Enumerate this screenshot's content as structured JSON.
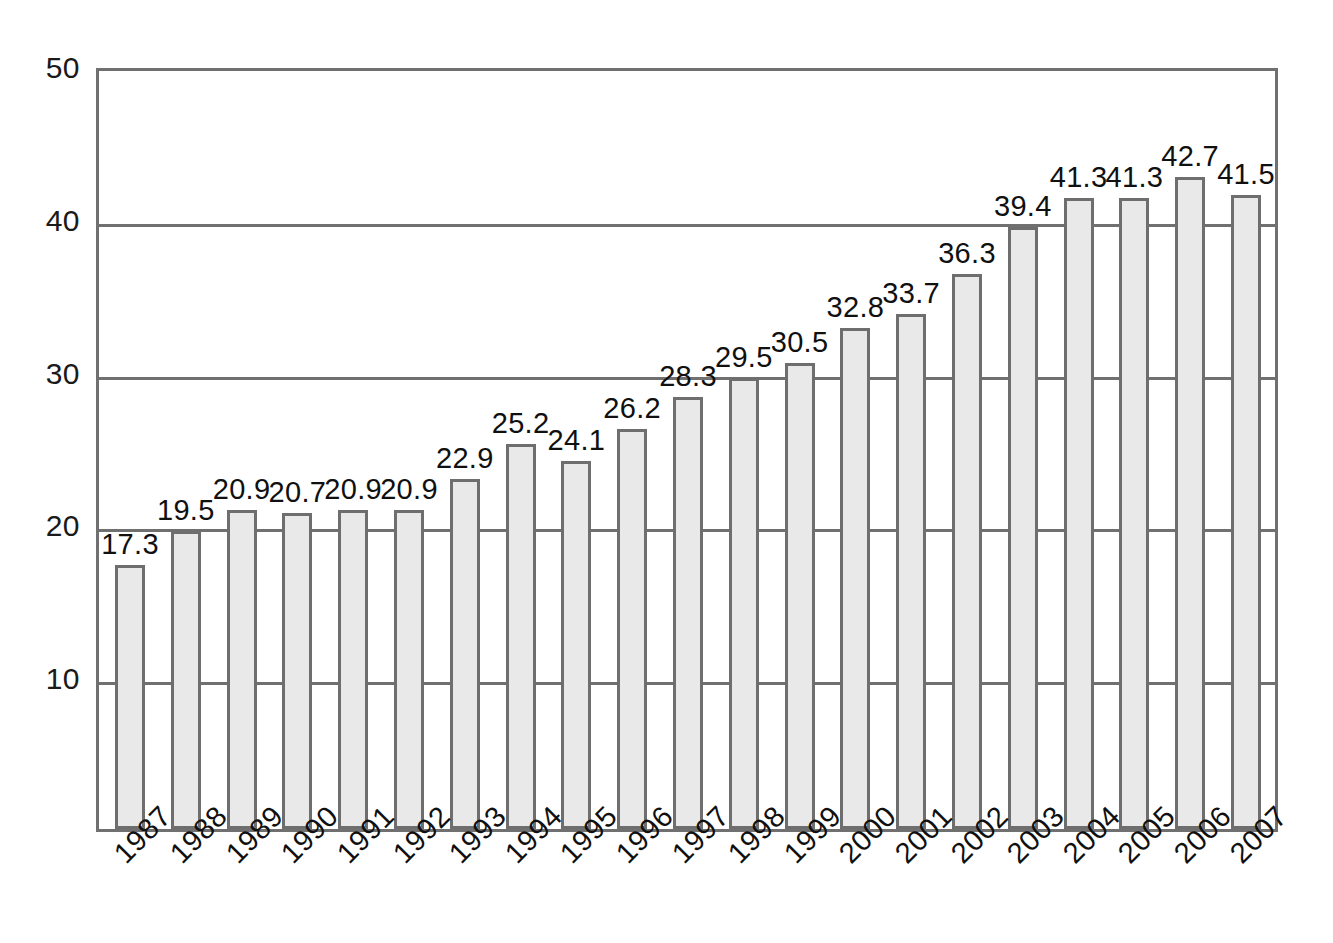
{
  "chart_data": {
    "type": "bar",
    "title": "",
    "subtitle": "",
    "xlabel": "",
    "ylabel": "",
    "ylim": [
      0,
      50
    ],
    "yticks": [
      10,
      20,
      30,
      40,
      50
    ],
    "grid": true,
    "legend": null,
    "categories": [
      "1987",
      "1988",
      "1989",
      "1990",
      "1991",
      "1992",
      "1993",
      "1994",
      "1995",
      "1996",
      "1997",
      "1998",
      "1999",
      "2000",
      "2001",
      "2002",
      "2003",
      "2004",
      "2005",
      "2006",
      "2007"
    ],
    "values": [
      17.3,
      19.5,
      20.9,
      20.7,
      20.9,
      20.9,
      22.9,
      25.2,
      24.1,
      26.2,
      28.3,
      29.5,
      30.5,
      32.8,
      33.7,
      36.3,
      39.4,
      41.3,
      41.3,
      42.7,
      41.5
    ],
    "value_labels": [
      "17.3",
      "19.5",
      "20.9",
      "20.7",
      "20.9",
      "20.9",
      "22.9",
      "25.2",
      "24.1",
      "26.2",
      "28.3",
      "29.5",
      "30.5",
      "32.8",
      "33.7",
      "36.3",
      "39.4",
      "41.3",
      "41.3",
      "42.7",
      "41.5"
    ],
    "ytick_labels": [
      "10",
      "20",
      "30",
      "40",
      "50"
    ],
    "colors": {
      "bar_fill": "#e9e9e9",
      "bar_border": "#6e6e6e",
      "axis": "#707070",
      "grid": "#707070",
      "text": "#101010",
      "background": "#ffffff"
    }
  }
}
